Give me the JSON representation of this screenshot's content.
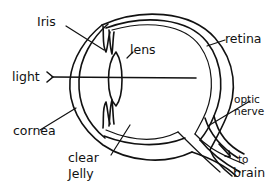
{
  "diagram": {
    "labels": {
      "iris": "Iris",
      "lens": "lens",
      "retina": "retina",
      "light": "light",
      "cornea": "cornea",
      "optic_nerve_1": "optic",
      "optic_nerve_2": "nerve",
      "clear_jelly_1": "clear",
      "jelly_2": "Jelly",
      "to_brain_1": "to",
      "to_brain_2": "brain"
    },
    "colors": {
      "ink": "#111111",
      "background": "#ffffff"
    }
  }
}
